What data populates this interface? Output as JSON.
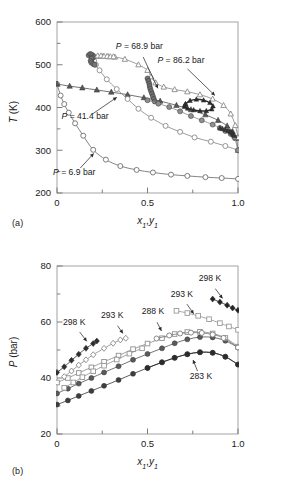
{
  "figure": {
    "panel_a_tag": "(a)",
    "panel_b_tag": "(b)"
  },
  "chart_data": [
    {
      "id": "panel-a",
      "type": "line",
      "title": "",
      "xlabel": "x₁,y₁",
      "ylabel": "T (K)",
      "xlim": [
        0,
        1
      ],
      "ylim": [
        200,
        600
      ],
      "xticks": [
        0,
        0.5,
        1
      ],
      "xtick_labels": [
        "0",
        "0.5",
        "1.0"
      ],
      "xminor": [
        0.25,
        0.75
      ],
      "yticks": [
        200,
        300,
        400,
        500,
        600
      ],
      "ytick_labels": [
        "200",
        "300",
        "400",
        "500",
        "600"
      ],
      "yminor": [
        250,
        350,
        450,
        550
      ],
      "grid": false,
      "legend_position": "none",
      "annotations": [
        {
          "text": "P = 68.9 bar",
          "x": 0.455,
          "y": 537,
          "anchor_x": 0.565,
          "anchor_y": 438
        },
        {
          "text": "P = 86.2 bar",
          "x": 0.685,
          "y": 505,
          "anchor_x": 0.885,
          "anchor_y": 423
        },
        {
          "text": "P = 41.4 bar",
          "x": 0.155,
          "y": 373,
          "anchor_x": 0.345,
          "anchor_y": 428
        },
        {
          "text": "P = 6.9 bar",
          "x": 0.095,
          "y": 243,
          "anchor_x": 0.215,
          "anchor_y": 298
        }
      ],
      "series": [
        {
          "name": "P = 6.9 bar",
          "marker": "open-circle",
          "color": "#6e6e6e",
          "x": [
            0.0,
            0.02,
            0.04,
            0.065,
            0.1,
            0.145,
            0.2,
            0.27,
            0.35,
            0.44,
            0.53,
            0.63,
            0.72,
            0.82,
            0.91,
            1.0
          ],
          "y": [
            455,
            428,
            408,
            388,
            363,
            334,
            301,
            278,
            263,
            254,
            248,
            243,
            240,
            237,
            235,
            233
          ]
        },
        {
          "name": "P = 41.4 bar bubble",
          "marker": "filled-triangle",
          "color": "#595959",
          "x": [
            0.0,
            0.07,
            0.14,
            0.22,
            0.3,
            0.39,
            0.48,
            0.57,
            0.66,
            0.74,
            0.82,
            0.89,
            0.94,
            0.97,
            0.99,
            1.0
          ],
          "y": [
            455,
            450,
            446,
            441,
            436,
            430,
            423,
            415,
            405,
            395,
            383,
            370,
            357,
            344,
            328,
            300
          ]
        },
        {
          "name": "P = 41.4 bar dew",
          "marker": "open-circle",
          "color": "#8a8a8a",
          "x": [
            0.185,
            0.2,
            0.205,
            0.215,
            0.235,
            0.275,
            0.33,
            0.39,
            0.45,
            0.52,
            0.6,
            0.68,
            0.76,
            0.85,
            0.93,
            1.0
          ],
          "y": [
            522,
            517,
            509,
            500,
            487,
            466,
            443,
            420,
            397,
            376,
            357,
            343,
            330,
            320,
            310,
            300
          ]
        },
        {
          "name": "P = 68.9 bar",
          "marker": "open-triangle",
          "color": "#8a8a8a",
          "x": [
            0.225,
            0.255,
            0.285,
            0.32,
            0.375,
            0.45,
            0.5,
            0.52,
            0.545,
            0.59,
            0.65,
            0.72,
            0.79,
            0.86,
            0.92,
            0.96,
            0.985,
            1.0
          ],
          "y": [
            520,
            520,
            519,
            518,
            513,
            500,
            487,
            472,
            458,
            448,
            442,
            437,
            430,
            420,
            405,
            385,
            358,
            330
          ]
        },
        {
          "name": "P = 68.9 bar cluster",
          "marker": "filled-circle",
          "color": "#707070",
          "x": [
            0.5,
            0.505,
            0.51,
            0.512,
            0.515,
            0.52,
            0.525,
            0.53,
            0.535,
            0.54
          ],
          "y": [
            468,
            462,
            456,
            450,
            444,
            438,
            432,
            426,
            420,
            414
          ]
        },
        {
          "name": "P = 86.2 bar vapor branch",
          "marker": "filled-circle",
          "color": "#8f8f8f",
          "x": [
            0.5,
            0.56,
            0.62,
            0.68,
            0.74,
            0.8,
            0.86,
            0.9,
            0.93,
            0.96,
            0.98,
            1.0
          ],
          "y": [
            417,
            409,
            401,
            391,
            380,
            370,
            360,
            352,
            345,
            338,
            330,
            300
          ]
        },
        {
          "name": "P = 86.2 bar loop",
          "marker": "filled-triangle-dense",
          "color": "#2b2b2b",
          "x": [
            0.71,
            0.735,
            0.77,
            0.81,
            0.845,
            0.862,
            0.855,
            0.825,
            0.79,
            0.755,
            0.722,
            0.705,
            0.705,
            0.71
          ],
          "y": [
            408,
            416,
            419,
            417,
            411,
            403,
            396,
            392,
            392,
            394,
            398,
            402,
            405,
            408
          ]
        },
        {
          "name": "P = 86.2 bar right cluster",
          "marker": "filled-triangle-dense",
          "color": "#3a3a3a",
          "x": [
            0.9,
            0.915,
            0.93,
            0.945,
            0.955,
            0.962,
            0.968,
            0.972,
            0.976,
            0.98
          ],
          "y": [
            352,
            350,
            348,
            346,
            344,
            342,
            340,
            338,
            336,
            334
          ]
        },
        {
          "name": "left cluster 500-525",
          "marker": "filled-circle",
          "color": "#767676",
          "x": [
            0.175,
            0.183,
            0.19,
            0.197,
            0.204,
            0.197,
            0.19,
            0.186,
            0.19,
            0.2,
            0.208
          ],
          "y": [
            522,
            525,
            524,
            522,
            519,
            516,
            514,
            509,
            505,
            502,
            500
          ]
        },
        {
          "name": "upper open triangles",
          "marker": "open-triangle",
          "color": "#8f8f8f",
          "x": [
            0.225,
            0.243,
            0.26,
            0.277,
            0.295,
            0.312
          ],
          "y": [
            521,
            521,
            520,
            520,
            519,
            519
          ]
        }
      ]
    },
    {
      "id": "panel-b",
      "type": "line",
      "title": "",
      "xlabel": "x₁,y₁",
      "ylabel": "P (bar)",
      "xlim": [
        0,
        1
      ],
      "ylim": [
        20,
        80
      ],
      "xticks": [
        0,
        0.5,
        1
      ],
      "xtick_labels": [
        "0",
        "0.5",
        "1.0"
      ],
      "xminor": [
        0.25,
        0.75
      ],
      "yticks": [
        20,
        40,
        60,
        80
      ],
      "ytick_labels": [
        "20",
        "40",
        "60",
        "80"
      ],
      "yminor": [
        30,
        50,
        70
      ],
      "grid": false,
      "legend_position": "none",
      "annotations": [
        {
          "text": "298 K",
          "x": 0.095,
          "y": 59.0,
          "anchor_x": 0.175,
          "anchor_y": 52.2
        },
        {
          "text": "293 K",
          "x": 0.305,
          "y": 61.3,
          "anchor_x": 0.375,
          "anchor_y": 55.0
        },
        {
          "text": "288 K",
          "x": 0.53,
          "y": 62.8,
          "anchor_x": 0.585,
          "anchor_y": 55.8
        },
        {
          "text": "293 K",
          "x": 0.69,
          "y": 69.0,
          "anchor_x": 0.765,
          "anchor_y": 62.0
        },
        {
          "text": "298 K",
          "x": 0.845,
          "y": 74.5,
          "anchor_x": 0.925,
          "anchor_y": 67.5
        },
        {
          "text": "283 K",
          "x": 0.795,
          "y": 39.5,
          "anchor_x": 0.745,
          "anchor_y": 47.5
        }
      ],
      "series": [
        {
          "name": "283 K bubble",
          "marker": "filled-circle",
          "color": "#3d3d3d",
          "x": [
            0.0,
            0.06,
            0.12,
            0.19,
            0.26,
            0.34,
            0.42,
            0.5,
            0.58,
            0.65,
            0.72,
            0.79,
            0.86,
            0.93,
            1.0
          ],
          "y": [
            30.5,
            32.0,
            33.6,
            35.4,
            37.2,
            39.3,
            41.5,
            43.6,
            45.6,
            47.2,
            48.5,
            49.2,
            49.0,
            47.6,
            44.8
          ]
        },
        {
          "name": "288 K bubble",
          "marker": "filled-circle",
          "color": "#5a5a5a",
          "x": [
            0.0,
            0.06,
            0.12,
            0.19,
            0.26,
            0.34,
            0.42,
            0.5,
            0.58,
            0.65,
            0.72,
            0.79,
            0.86,
            0.93,
            1.0
          ],
          "y": [
            34.5,
            36.2,
            38.0,
            40.0,
            42.0,
            44.2,
            46.5,
            48.6,
            50.6,
            52.4,
            53.8,
            54.6,
            54.5,
            53.3,
            50.9
          ]
        },
        {
          "name": "293 K bubble",
          "marker": "open-square",
          "color": "#8f8f8f",
          "x": [
            0.0,
            0.06,
            0.12,
            0.19,
            0.26,
            0.34,
            0.42,
            0.5,
            0.58,
            0.65,
            0.72,
            0.79,
            0.86,
            0.93,
            1.0
          ],
          "y": [
            38.4,
            40.0,
            41.8,
            43.8,
            45.8,
            48.0,
            50.3,
            52.3,
            54.2,
            55.7,
            56.4,
            56.5,
            55.9,
            54.3,
            51.2
          ]
        },
        {
          "name": "298 K bubble",
          "marker": "filled-diamond",
          "color": "#2f2f2f",
          "x": [
            0.0,
            0.04,
            0.08,
            0.12,
            0.16,
            0.2,
            0.22
          ],
          "y": [
            42.0,
            44.0,
            46.3,
            48.5,
            50.6,
            52.3,
            53.2
          ]
        },
        {
          "name": "283 K dew",
          "marker": "filled-circle",
          "color": "#2b2b2b",
          "x": [
            0.5,
            0.58,
            0.65,
            0.72,
            0.79,
            0.86,
            0.93,
            1.0
          ],
          "y": [
            43.6,
            45.6,
            47.2,
            48.5,
            49.2,
            49.0,
            47.6,
            44.8
          ]
        },
        {
          "name": "288 K dew",
          "marker": "open-circle",
          "color": "#7d7d7d",
          "x": [
            0.55,
            0.62,
            0.68,
            0.74,
            0.8,
            0.86,
            0.92,
            1.0
          ],
          "y": [
            54.1,
            55.2,
            55.9,
            56.2,
            56.1,
            55.5,
            54.3,
            50.9
          ]
        },
        {
          "name": "293 K dew",
          "marker": "open-square",
          "color": "#9a9a9a",
          "x": [
            0.66,
            0.72,
            0.78,
            0.84,
            0.9,
            0.95,
            1.0
          ],
          "y": [
            64.0,
            63.2,
            62.2,
            61.0,
            59.6,
            58.4,
            57.2
          ]
        },
        {
          "name": "298 K dew",
          "marker": "filled-diamond",
          "color": "#252525",
          "x": [
            0.86,
            0.9,
            0.94,
            0.97,
            1.0
          ],
          "y": [
            68.2,
            67.1,
            66.0,
            65.0,
            64.2
          ]
        },
        {
          "name": "293 K left cluster",
          "marker": "open-diamond",
          "color": "#8a8a8a",
          "x": [
            0.04,
            0.08,
            0.12,
            0.16,
            0.2,
            0.26,
            0.31,
            0.35,
            0.38
          ],
          "y": [
            40.5,
            42.5,
            44.6,
            46.5,
            48.3,
            50.6,
            52.4,
            53.6,
            54.2
          ]
        },
        {
          "name": "288 K left cluster",
          "marker": "open-square",
          "color": "#959595",
          "x": [
            0.04,
            0.09,
            0.14,
            0.2,
            0.26,
            0.33,
            0.4,
            0.47
          ],
          "y": [
            36.5,
            38.4,
            40.3,
            42.4,
            44.4,
            46.6,
            48.7,
            50.6
          ]
        }
      ]
    }
  ]
}
